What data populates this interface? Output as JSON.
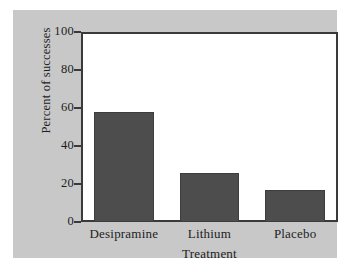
{
  "chart_data": {
    "type": "bar",
    "title": "",
    "subtitle": "",
    "xlabel": "Treatment",
    "ylabel": "Percent of successes",
    "categories": [
      "Desipramine",
      "Lithium",
      "Placebo"
    ],
    "values": [
      58,
      26,
      17
    ],
    "ylim": [
      0,
      100
    ],
    "yticks": [
      0,
      20,
      40,
      60,
      80,
      100
    ],
    "ytick_labels": [
      "0",
      "20",
      "40",
      "60",
      "80",
      "100"
    ],
    "grid": false,
    "legend": null,
    "annotations": [],
    "series": [
      {
        "name": "Percent of successes",
        "values": [
          58,
          26,
          17
        ]
      }
    ]
  },
  "style": {
    "figure_background": "#c8c8c8",
    "page_background": "#ffffff",
    "plot_background": "#ffffff",
    "bar_color": "#4d4d4d",
    "axis_color": "#3a3a3a",
    "text_color": "#1d1d1d"
  }
}
